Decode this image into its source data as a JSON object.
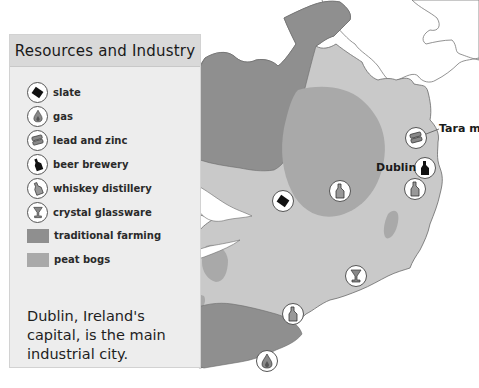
{
  "legend": {
    "title": "Resources and Industry",
    "items": [
      {
        "icon": "slate-icon",
        "label": "slate"
      },
      {
        "icon": "gas-flame-icon",
        "label": "gas"
      },
      {
        "icon": "lead-zinc-ingots-icon",
        "label": "lead and zinc"
      },
      {
        "icon": "beer-bottle-icon",
        "label": "beer brewery"
      },
      {
        "icon": "whiskey-bottle-icon",
        "label": "whiskey distillery"
      },
      {
        "icon": "crystal-glass-icon",
        "label": "crystal glassware"
      },
      {
        "swatch": "#8f8f8f",
        "label": "traditional farming"
      },
      {
        "swatch": "#a9a9a9",
        "label": "peat bogs"
      }
    ],
    "note": "Dublin, Ireland's capital, is the main industrial city."
  },
  "map": {
    "labels": {
      "dublin": "Dublin",
      "tara": "Tara mi"
    },
    "colors": {
      "land": "#c9c9c9",
      "farming": "#8f8f8f",
      "peat": "#a9a9a9",
      "outline": "#6a6a6a"
    }
  }
}
